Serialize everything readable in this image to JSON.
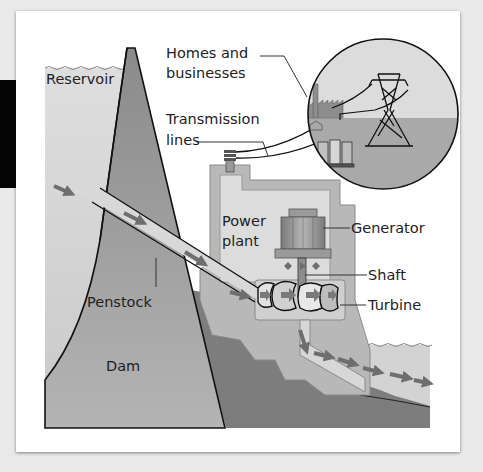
{
  "diagram": {
    "labels": {
      "reservoir": "Reservoir",
      "homes_line1": "Homes and",
      "homes_line2": "businesses",
      "transmission_line1": "Transmission",
      "transmission_line2": "lines",
      "power_line1": "Power",
      "power_line2": "plant",
      "generator": "Generator",
      "shaft": "Shaft",
      "turbine": "Turbine",
      "penstock": "Penstock",
      "dam": "Dam"
    },
    "colors": {
      "background": "#e9e9e9",
      "card": "#ffffff",
      "water": "#d4d4d4",
      "dam": "#8f8f8f",
      "ground": "#7b7b7b",
      "plant": "#b9b9b9",
      "plant_inner": "#dcdcdc",
      "arrow": "#6e6e6e",
      "outline": "#111111"
    }
  }
}
